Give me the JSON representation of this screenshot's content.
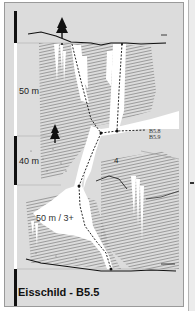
{
  "topo": {
    "title": "Eisschild - B5.5",
    "pitch_labels": [
      {
        "id": "pitch-1",
        "text": "50 m"
      },
      {
        "id": "pitch-2",
        "text": "40 m"
      },
      {
        "id": "pitch-3",
        "text": "50 m / 3+"
      }
    ],
    "grade_label": "4",
    "route_refs": [
      "B5.8",
      "B5.9"
    ],
    "scale_segments": [
      "black",
      "white",
      "black",
      "white",
      "black"
    ],
    "colors": {
      "background": "#dcdcdc",
      "ice": "#ffffff",
      "rock_hatch": "#8c8c8c",
      "line": "#111111"
    }
  }
}
